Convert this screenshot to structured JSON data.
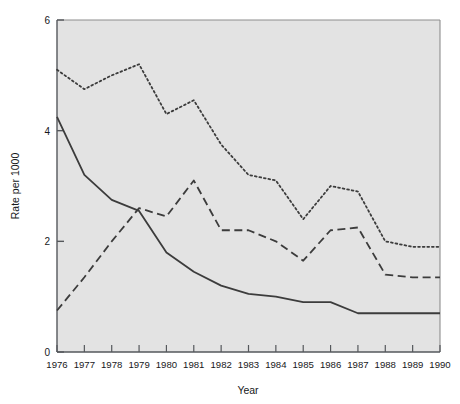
{
  "chart_data": {
    "type": "line",
    "title": "",
    "xlabel": "Year",
    "ylabel": "Rate per 1000",
    "x": [
      1976,
      1977,
      1978,
      1979,
      1980,
      1981,
      1982,
      1983,
      1984,
      1985,
      1986,
      1987,
      1988,
      1989,
      1990
    ],
    "xticklabels": [
      "1976",
      "1977",
      "1978",
      "1979",
      "1980",
      "1981",
      "1982",
      "1983",
      "1984",
      "1985",
      "1986",
      "1987",
      "1988",
      "1989",
      "1990"
    ],
    "yticklabels": [
      "0",
      "2",
      "4",
      "6"
    ],
    "yticks": [
      0,
      2,
      4,
      6
    ],
    "xlim": [
      1976,
      1990
    ],
    "ylim": [
      0,
      6
    ],
    "grid": false,
    "legend": "none",
    "plot_background": "#e3e3e3",
    "line_color": "#3c3c3c",
    "series": [
      {
        "name": "series-solid",
        "style": "solid",
        "values": [
          4.25,
          3.2,
          2.75,
          2.55,
          1.8,
          1.45,
          1.2,
          1.05,
          1.0,
          0.9,
          0.9,
          0.7,
          0.7,
          0.7,
          0.7
        ]
      },
      {
        "name": "series-dashed",
        "style": "dashed",
        "values": [
          0.75,
          1.35,
          2.0,
          2.6,
          2.45,
          3.1,
          2.2,
          2.2,
          2.0,
          1.65,
          2.2,
          2.25,
          1.4,
          1.35,
          1.35
        ]
      },
      {
        "name": "series-dotted",
        "style": "dotted",
        "values": [
          5.1,
          4.75,
          5.0,
          5.2,
          4.3,
          4.55,
          3.75,
          3.2,
          3.1,
          2.4,
          3.0,
          2.9,
          2.0,
          1.9,
          1.9
        ]
      }
    ]
  }
}
